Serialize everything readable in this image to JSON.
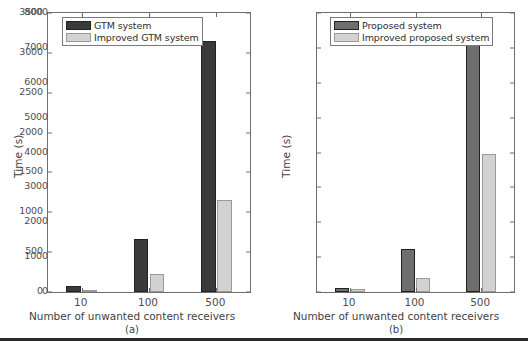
{
  "figure": {
    "background": "#ffffff",
    "bottom_rule_color": "#2b2b2b"
  },
  "chart_data": [
    {
      "type": "bar",
      "panel": "(a)",
      "title": "",
      "xlabel": "Number of unwanted content receivers",
      "ylabel": "Time (s)",
      "categories": [
        "10",
        "100",
        "500"
      ],
      "ylim": [
        0,
        3500
      ],
      "yticks": [
        0,
        500,
        1000,
        1500,
        2000,
        2500,
        3000,
        3500
      ],
      "ytick_labels": [
        "0",
        "500",
        "1000",
        "1500",
        "2000",
        "2500",
        "3000",
        "3500"
      ],
      "grid": false,
      "legend_position": "upper left",
      "series": [
        {
          "name": "GTM system",
          "color": "#3a3a3a",
          "values": [
            75,
            660,
            3150
          ]
        },
        {
          "name": "Improved GTM system",
          "color": "#d2d2d2",
          "values": [
            25,
            230,
            1150
          ]
        }
      ]
    },
    {
      "type": "bar",
      "panel": "(b)",
      "title": "",
      "xlabel": "Number of unwanted content receivers",
      "ylabel": "Time (s)",
      "categories": [
        "10",
        "100",
        "500"
      ],
      "ylim": [
        0,
        8000
      ],
      "yticks": [
        0,
        1000,
        2000,
        3000,
        4000,
        5000,
        6000,
        7000,
        8000
      ],
      "ytick_labels": [
        "0",
        "1000",
        "2000",
        "3000",
        "4000",
        "5000",
        "6000",
        "7000",
        "8000"
      ],
      "grid": false,
      "legend_position": "upper left",
      "series": [
        {
          "name": "Proposed system",
          "color": "#6e6e6e",
          "values": [
            120,
            1220,
            7800
          ]
        },
        {
          "name": "Improved proposed system",
          "color": "#d2d2d2",
          "values": [
            80,
            400,
            3970
          ]
        }
      ]
    }
  ]
}
